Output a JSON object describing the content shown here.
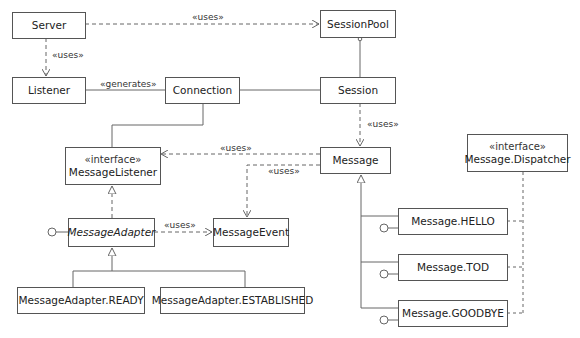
{
  "diagram": {
    "type": "UML class diagram",
    "colors": {
      "line": "#666666",
      "border": "#555555",
      "text": "#222222",
      "background": "#ffffff"
    },
    "classes": {
      "server": {
        "name": "Server"
      },
      "session_pool": {
        "name": "SessionPool"
      },
      "listener": {
        "name": "Listener"
      },
      "connection": {
        "name": "Connection"
      },
      "session": {
        "name": "Session"
      },
      "message_listener": {
        "stereotype": "«interface»",
        "name": "MessageListener"
      },
      "message": {
        "name": "Message"
      },
      "message_dispatcher": {
        "stereotype": "«interface»",
        "name": "Message.Dispatcher"
      },
      "message_adapter": {
        "name": "MessageAdapter",
        "abstract": true
      },
      "message_event": {
        "name": "MessageEvent"
      },
      "message_adapter_ready": {
        "name": "MessageAdapter.READY"
      },
      "message_adapter_established": {
        "name": "MessageAdapter.ESTABLISHED"
      },
      "message_hello": {
        "name": "Message.HELLO"
      },
      "message_tod": {
        "name": "Message.TOD"
      },
      "message_goodbye": {
        "name": "Message.GOODBYE"
      }
    },
    "relationships": {
      "server_sessionpool": {
        "from": "Server",
        "to": "SessionPool",
        "kind": "dependency",
        "label": "«uses»"
      },
      "server_listener": {
        "from": "Server",
        "to": "Listener",
        "kind": "dependency",
        "label": "«uses»"
      },
      "listener_connection": {
        "from": "Listener",
        "to": "Connection",
        "kind": "association",
        "label": "«generates»"
      },
      "connection_session": {
        "from": "Connection",
        "to": "Session",
        "kind": "association"
      },
      "sessionpool_session": {
        "from": "SessionPool",
        "to": "Session",
        "kind": "aggregation"
      },
      "connection_messagelistener": {
        "from": "Connection",
        "to": "MessageListener",
        "kind": "association"
      },
      "session_message": {
        "from": "Session",
        "to": "Message",
        "kind": "dependency",
        "label": "«uses»"
      },
      "message_messagelistener": {
        "from": "Message",
        "to": "MessageListener",
        "kind": "dependency",
        "label": "«uses»"
      },
      "message_messageevent": {
        "from": "Message",
        "to": "MessageEvent",
        "kind": "dependency",
        "label": "«uses»"
      },
      "adapter_event": {
        "from": "MessageAdapter",
        "to": "MessageEvent",
        "kind": "dependency",
        "label": "«uses»"
      },
      "adapter_listener": {
        "from": "MessageAdapter",
        "to": "MessageListener",
        "kind": "realization"
      },
      "ready_adapter": {
        "from": "MessageAdapter.READY",
        "to": "MessageAdapter",
        "kind": "generalization"
      },
      "established_adapter": {
        "from": "MessageAdapter.ESTABLISHED",
        "to": "MessageAdapter",
        "kind": "generalization"
      },
      "hello_message": {
        "from": "Message.HELLO",
        "to": "Message",
        "kind": "generalization"
      },
      "tod_message": {
        "from": "Message.TOD",
        "to": "Message",
        "kind": "generalization"
      },
      "goodbye_message": {
        "from": "Message.GOODBYE",
        "to": "Message",
        "kind": "generalization"
      },
      "messages_dispatcher": {
        "from": [
          "Message.HELLO",
          "Message.TOD",
          "Message.GOODBYE"
        ],
        "to": "Message.Dispatcher",
        "kind": "dependency"
      }
    },
    "provided_interfaces": [
      "MessageAdapter",
      "Message.HELLO",
      "Message.TOD",
      "Message.GOODBYE"
    ]
  }
}
